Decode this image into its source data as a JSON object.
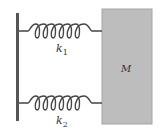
{
  "diagram": {
    "spring_top": {
      "label": "k",
      "subscript": "1"
    },
    "spring_bottom": {
      "label": "k",
      "subscript": "2"
    },
    "mass": {
      "label": "M"
    },
    "colors": {
      "wall": "#555555",
      "spring": "#444444",
      "mass_fill": "#bdbdbd",
      "mass_border": "#9a9a9a"
    }
  }
}
